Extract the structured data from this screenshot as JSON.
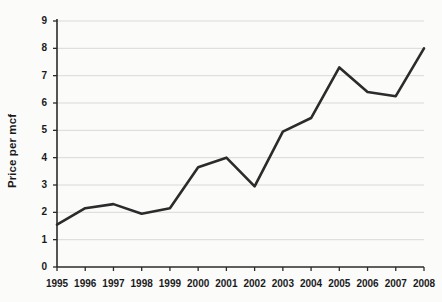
{
  "chart_data": {
    "type": "line",
    "title": "",
    "xlabel": "",
    "ylabel": "Price per mcf",
    "categories": [
      "1995",
      "1996",
      "1997",
      "1998",
      "1999",
      "2000",
      "2001",
      "2002",
      "2003",
      "2004",
      "2005",
      "2006",
      "2007",
      "2008"
    ],
    "values": [
      1.55,
      2.15,
      2.3,
      1.95,
      2.15,
      3.65,
      4.0,
      2.95,
      4.95,
      5.45,
      7.3,
      6.4,
      6.25,
      8.0
    ],
    "series": [
      {
        "name": "Price per mcf",
        "values": [
          1.55,
          2.15,
          2.3,
          1.95,
          2.15,
          3.65,
          4.0,
          2.95,
          4.95,
          5.45,
          7.3,
          6.4,
          6.25,
          8.0
        ]
      }
    ],
    "ylim": [
      0,
      9
    ],
    "yticks": [
      "0",
      "1",
      "2",
      "3",
      "4",
      "5",
      "6",
      "7",
      "8",
      "9"
    ],
    "xticks": [
      "1995",
      "1996",
      "1997",
      "1998",
      "1999",
      "2000",
      "2001",
      "2002",
      "2003",
      "2004",
      "2005",
      "2006",
      "2007",
      "2008"
    ],
    "grid": "horizontal",
    "legend": "none",
    "colors": {
      "line": "#2b2b2b",
      "grid": "#d9d9d9",
      "axis": "#2b2b2b",
      "text": "#1a1a1a",
      "background": "#fbfbfa"
    }
  }
}
